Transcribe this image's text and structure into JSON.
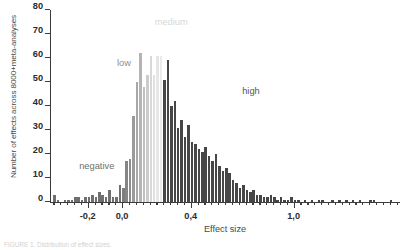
{
  "chart_data": {
    "type": "bar",
    "title": "",
    "xlabel": "Effect size",
    "ylabel": "Number of effects across 8000+meta-analyses",
    "ylim": [
      0,
      80
    ],
    "xlim": [
      -0.42,
      1.62
    ],
    "yticks": [
      0,
      10,
      20,
      30,
      40,
      50,
      60,
      70,
      80
    ],
    "ytick_labels": [
      "0",
      "10",
      "20",
      "30",
      "40",
      "50",
      "60",
      "70",
      "80"
    ],
    "xticks": [
      -0.2,
      0.0,
      0.4,
      1.0
    ],
    "xtick_labels": [
      "-0,2",
      "0,0",
      "0,4",
      "1,0"
    ],
    "grid": false,
    "legend": "none",
    "bin_width": 0.02,
    "annotations": [
      {
        "label": "negative",
        "x": -0.25,
        "y": 13,
        "color": "#6e6e6e"
      },
      {
        "label": "low",
        "x": -0.03,
        "y": 56,
        "color": "#8e8e8e"
      },
      {
        "label": "medium",
        "x": 0.19,
        "y": 73,
        "color": "#d8d8d8"
      },
      {
        "label": "high",
        "x": 0.7,
        "y": 44,
        "color": "#555555"
      }
    ],
    "region_colors": {
      "negative": "#6f6f6f",
      "low": "#9a9a9a",
      "medium": "#e2e2e2",
      "high": "#464646"
    },
    "bars": [
      {
        "x": -0.4,
        "y": 3,
        "c": "#6f6f6f"
      },
      {
        "x": -0.38,
        "y": 1,
        "c": "#6f6f6f"
      },
      {
        "x": -0.36,
        "y": 0,
        "c": "#6f6f6f"
      },
      {
        "x": -0.34,
        "y": 1,
        "c": "#6f6f6f"
      },
      {
        "x": -0.32,
        "y": 1,
        "c": "#6f6f6f"
      },
      {
        "x": -0.3,
        "y": 1,
        "c": "#6f6f6f"
      },
      {
        "x": -0.28,
        "y": 2,
        "c": "#6f6f6f"
      },
      {
        "x": -0.26,
        "y": 2,
        "c": "#6f6f6f"
      },
      {
        "x": -0.24,
        "y": 1,
        "c": "#6f6f6f"
      },
      {
        "x": -0.22,
        "y": 2,
        "c": "#6f6f6f"
      },
      {
        "x": -0.2,
        "y": 2,
        "c": "#6f6f6f"
      },
      {
        "x": -0.18,
        "y": 3,
        "c": "#6f6f6f"
      },
      {
        "x": -0.16,
        "y": 2,
        "c": "#6f6f6f"
      },
      {
        "x": -0.14,
        "y": 4,
        "c": "#6f6f6f"
      },
      {
        "x": -0.12,
        "y": 3,
        "c": "#6f6f6f"
      },
      {
        "x": -0.1,
        "y": 2,
        "c": "#6f6f6f"
      },
      {
        "x": -0.08,
        "y": 5,
        "c": "#6f6f6f"
      },
      {
        "x": -0.06,
        "y": 2,
        "c": "#6f6f6f"
      },
      {
        "x": -0.04,
        "y": 2,
        "c": "#6f6f6f"
      },
      {
        "x": -0.02,
        "y": 7,
        "c": "#6f6f6f"
      },
      {
        "x": 0.0,
        "y": 6,
        "c": "#7d7d7d"
      },
      {
        "x": 0.02,
        "y": 17,
        "c": "#858585"
      },
      {
        "x": 0.04,
        "y": 18,
        "c": "#8d8d8d"
      },
      {
        "x": 0.06,
        "y": 36,
        "c": "#9a9a9a"
      },
      {
        "x": 0.08,
        "y": 50,
        "c": "#a8a8a8"
      },
      {
        "x": 0.1,
        "y": 62,
        "c": "#b4b4b4"
      },
      {
        "x": 0.12,
        "y": 48,
        "c": "#c0c0c0"
      },
      {
        "x": 0.14,
        "y": 53,
        "c": "#cccccc"
      },
      {
        "x": 0.16,
        "y": 61,
        "c": "#d8d8d8"
      },
      {
        "x": 0.18,
        "y": 53,
        "c": "#e0e0e0"
      },
      {
        "x": 0.2,
        "y": 61,
        "c": "#e6e6e6"
      },
      {
        "x": 0.22,
        "y": 61,
        "c": "#eaeaea"
      },
      {
        "x": 0.24,
        "y": 51,
        "c": "#464646"
      },
      {
        "x": 0.26,
        "y": 59,
        "c": "#464646"
      },
      {
        "x": 0.28,
        "y": 40,
        "c": "#464646"
      },
      {
        "x": 0.3,
        "y": 42,
        "c": "#464646"
      },
      {
        "x": 0.32,
        "y": 31,
        "c": "#464646"
      },
      {
        "x": 0.34,
        "y": 34,
        "c": "#464646"
      },
      {
        "x": 0.36,
        "y": 27,
        "c": "#464646"
      },
      {
        "x": 0.38,
        "y": 32,
        "c": "#464646"
      },
      {
        "x": 0.4,
        "y": 25,
        "c": "#464646"
      },
      {
        "x": 0.42,
        "y": 24,
        "c": "#464646"
      },
      {
        "x": 0.44,
        "y": 22,
        "c": "#464646"
      },
      {
        "x": 0.46,
        "y": 21,
        "c": "#464646"
      },
      {
        "x": 0.48,
        "y": 23,
        "c": "#464646"
      },
      {
        "x": 0.5,
        "y": 19,
        "c": "#464646"
      },
      {
        "x": 0.52,
        "y": 17,
        "c": "#464646"
      },
      {
        "x": 0.54,
        "y": 20,
        "c": "#464646"
      },
      {
        "x": 0.56,
        "y": 15,
        "c": "#464646"
      },
      {
        "x": 0.58,
        "y": 13,
        "c": "#464646"
      },
      {
        "x": 0.6,
        "y": 14,
        "c": "#464646"
      },
      {
        "x": 0.62,
        "y": 12,
        "c": "#464646"
      },
      {
        "x": 0.64,
        "y": 9,
        "c": "#464646"
      },
      {
        "x": 0.66,
        "y": 8,
        "c": "#464646"
      },
      {
        "x": 0.68,
        "y": 6,
        "c": "#464646"
      },
      {
        "x": 0.7,
        "y": 7,
        "c": "#464646"
      },
      {
        "x": 0.72,
        "y": 5,
        "c": "#464646"
      },
      {
        "x": 0.74,
        "y": 4,
        "c": "#464646"
      },
      {
        "x": 0.76,
        "y": 5,
        "c": "#464646"
      },
      {
        "x": 0.78,
        "y": 3,
        "c": "#464646"
      },
      {
        "x": 0.8,
        "y": 3,
        "c": "#464646"
      },
      {
        "x": 0.82,
        "y": 2,
        "c": "#464646"
      },
      {
        "x": 0.84,
        "y": 2,
        "c": "#464646"
      },
      {
        "x": 0.86,
        "y": 3,
        "c": "#464646"
      },
      {
        "x": 0.88,
        "y": 2,
        "c": "#464646"
      },
      {
        "x": 0.9,
        "y": 1,
        "c": "#464646"
      },
      {
        "x": 0.92,
        "y": 2,
        "c": "#464646"
      },
      {
        "x": 0.94,
        "y": 1,
        "c": "#464646"
      },
      {
        "x": 0.96,
        "y": 1,
        "c": "#464646"
      },
      {
        "x": 0.98,
        "y": 2,
        "c": "#464646"
      },
      {
        "x": 1.0,
        "y": 1,
        "c": "#464646"
      },
      {
        "x": 1.02,
        "y": 1,
        "c": "#464646"
      },
      {
        "x": 1.06,
        "y": 1,
        "c": "#464646"
      },
      {
        "x": 1.1,
        "y": 1,
        "c": "#464646"
      },
      {
        "x": 1.14,
        "y": 1,
        "c": "#464646"
      },
      {
        "x": 1.16,
        "y": 1,
        "c": "#464646"
      },
      {
        "x": 1.22,
        "y": 1,
        "c": "#464646"
      },
      {
        "x": 1.26,
        "y": 1,
        "c": "#464646"
      },
      {
        "x": 1.3,
        "y": 1,
        "c": "#464646"
      },
      {
        "x": 1.34,
        "y": 1,
        "c": "#464646"
      },
      {
        "x": 1.38,
        "y": 1,
        "c": "#464646"
      },
      {
        "x": 1.44,
        "y": 1,
        "c": "#464646"
      },
      {
        "x": 1.46,
        "y": 1,
        "c": "#464646"
      },
      {
        "x": 1.56,
        "y": 1,
        "c": "#464646"
      }
    ],
    "xtick_minor_step": 0.04
  },
  "caption": {
    "text": "FIGURE 1. Distribution of effect sizes."
  }
}
